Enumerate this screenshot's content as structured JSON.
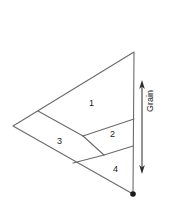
{
  "figure": {
    "type": "geometric-diagram",
    "background_color": "#ffffff",
    "line_color": "#6b6b6b",
    "label_color": "#1a1a1a",
    "canvas": {
      "width": 169,
      "height": 205
    },
    "outline": {
      "name": "main-triangle",
      "points": [
        {
          "x": 134,
          "y": 52
        },
        {
          "x": 13,
          "y": 126
        },
        {
          "x": 133,
          "y": 194
        }
      ]
    },
    "vertices": {
      "apex_top": {
        "x": 134,
        "y": 52
      },
      "left": {
        "x": 13,
        "y": 126
      },
      "apex_bottom": {
        "x": 133,
        "y": 194
      },
      "upper_edge_mid": {
        "x": 38,
        "y": 111
      },
      "right_edge_upper": {
        "x": 134,
        "y": 119
      },
      "right_edge_lower": {
        "x": 133,
        "y": 146
      },
      "inner_junction_upper": {
        "x": 83,
        "y": 136
      },
      "inner_junction_lower": {
        "x": 104,
        "y": 155
      },
      "lower_edge_point": {
        "x": 73,
        "y": 163
      }
    },
    "internal_lines": [
      {
        "name": "line-1-to-3",
        "from": {
          "x": 38,
          "y": 111
        },
        "to": {
          "x": 83,
          "y": 136
        }
      },
      {
        "name": "line-1-2-divider",
        "from": {
          "x": 83,
          "y": 136
        },
        "to": {
          "x": 134,
          "y": 119
        }
      },
      {
        "name": "line-2-4-divider",
        "from": {
          "x": 104,
          "y": 155
        },
        "to": {
          "x": 133,
          "y": 146
        }
      },
      {
        "name": "line-3-junction",
        "from": {
          "x": 83,
          "y": 136
        },
        "to": {
          "x": 104,
          "y": 155
        }
      },
      {
        "name": "line-3-4-divider",
        "from": {
          "x": 73,
          "y": 163
        },
        "to": {
          "x": 104,
          "y": 155
        }
      }
    ],
    "bottom_dot": {
      "x": 133,
      "y": 194,
      "r": 2.6,
      "color": "#1a1a1a"
    },
    "regions": [
      {
        "id": "region-1",
        "label": "1",
        "x": 89,
        "y": 99
      },
      {
        "id": "region-2",
        "label": "2",
        "x": 110,
        "y": 130
      },
      {
        "id": "region-3",
        "label": "3",
        "x": 57,
        "y": 137
      },
      {
        "id": "region-4",
        "label": "4",
        "x": 113,
        "y": 165
      }
    ],
    "grain_annotation": {
      "label": "Grain",
      "orientation": "vertical",
      "arrow": {
        "name": "grain-arrow",
        "x": 142,
        "y_top": 82,
        "y_bottom": 172,
        "double_headed": true,
        "color": "#2b2b2b"
      }
    }
  }
}
